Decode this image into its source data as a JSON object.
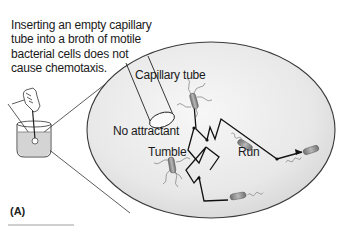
{
  "caption": {
    "text": "Inserting an empty capillary tube into a broth of motile bacterial cells does not cause chemotaxis."
  },
  "labels": {
    "capillary_tube": "Capillary tube",
    "no_attractant": "No attractant",
    "tumble": "Tumble",
    "run": "Run"
  },
  "panel_label": "(A)",
  "colors": {
    "ellipse_fill": "#e6e6e6",
    "ellipse_edge": "#3a3a3a",
    "beaker_liquid": "#d9d9d9",
    "path_line": "#111111",
    "bacterium": "#8a8a8a"
  }
}
